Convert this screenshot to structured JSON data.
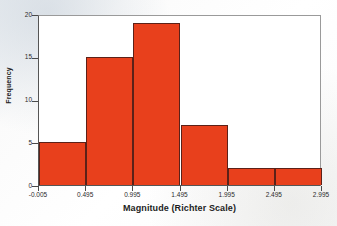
{
  "figure": {
    "name": "earthquake-magnitude-histogram",
    "background_color": "#ffffff",
    "frame_color": "#8a8a8a"
  },
  "chart_data": {
    "type": "bar",
    "title": "",
    "subtitle": "",
    "xlabel": "Magnitude (Richter Scale)",
    "ylabel": "Frequency",
    "bar_color": "#e8401c",
    "bar_edge_color": "#5c2118",
    "grid": false,
    "legend": false,
    "legend_position": "none",
    "xlim": [
      -0.005,
      2.995
    ],
    "ylim": [
      0,
      20
    ],
    "bin_width": 0.5,
    "bin_edges": [
      -0.005,
      0.495,
      0.995,
      1.495,
      1.995,
      2.495,
      2.995
    ],
    "categories": [
      "-0.005 to 0.495",
      "0.495 to 0.995",
      "0.995 to 1.495",
      "1.495 to 1.995",
      "1.995 to 2.495",
      "2.495 to 2.995"
    ],
    "values": [
      5,
      15,
      19,
      7,
      2,
      2
    ],
    "total_count": 50,
    "xticks": [
      -0.005,
      0.495,
      0.995,
      1.495,
      1.995,
      2.495,
      2.995
    ],
    "xtick_labels": [
      "-0.005",
      "0.495",
      "0.995",
      "1.495",
      "1.995",
      "2.495",
      "2.995"
    ],
    "yticks": [
      0,
      5,
      10,
      15,
      20
    ],
    "ytick_labels": [
      "0",
      "5",
      "10",
      "15",
      "20"
    ]
  }
}
